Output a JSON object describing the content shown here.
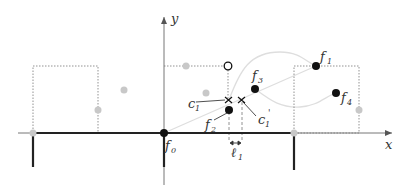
{
  "diagram": {
    "axes": {
      "x_label": "x",
      "y_label": "y"
    },
    "labels": {
      "f0": "f",
      "f0_sub": "0",
      "f1": "f",
      "f1_sub": "1",
      "f2": "f",
      "f2_sub": "2",
      "f3": "f",
      "f3_sub": "3",
      "f4": "f",
      "f4_sub": "4",
      "c1": "c",
      "c1_sub": "1",
      "c1p": "c",
      "c1p_sub": "1",
      "c1p_prime": "'",
      "l1": "ℓ",
      "l1_sub": "1"
    },
    "colors": {
      "axis": "#666666",
      "thick_line": "#222222",
      "black_point": "#111111",
      "gray_point": "#c8c8c8",
      "curve": "#dcdcdc",
      "dotted": "#777777"
    }
  }
}
